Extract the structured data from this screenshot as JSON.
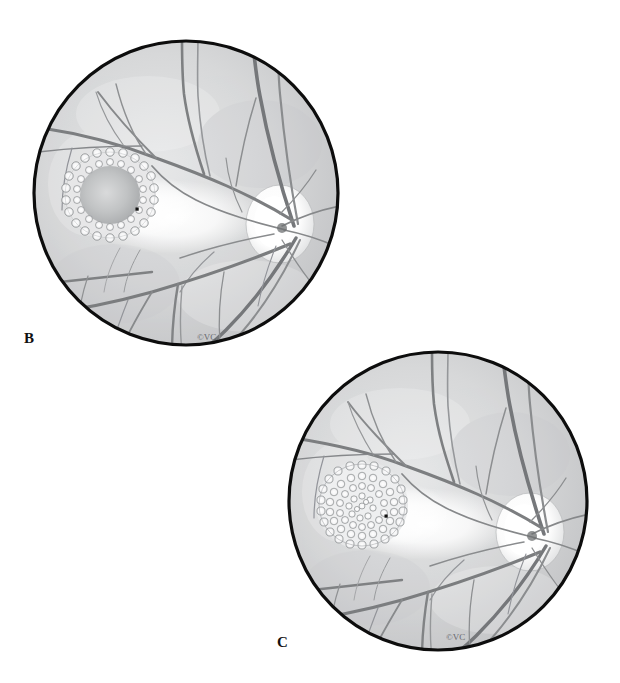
{
  "figure": {
    "modality": "fundus-drawing",
    "rendering": "grayscale pen-and-ink with wash",
    "background_color": "#ffffff",
    "panels": [
      {
        "id": "B",
        "label": "B",
        "label_position": {
          "x": 24,
          "y": 330
        },
        "signature": "©VC",
        "signature_position": {
          "x": 197,
          "y": 337
        },
        "circle": {
          "cx": 186,
          "cy": 193,
          "r": 156
        },
        "rim_color": "#0d0d0d",
        "fundus_color": "#d5d6d7",
        "description": "Right eye fundus with a ring of discrete pale drusen encircling a shaded macular lesion; optic disc temporal at right with radiating retinal vessels.",
        "lesion": {
          "name": "macular-lesion-ring",
          "cx": 110,
          "cy": 195,
          "rx": 45,
          "ry": 42,
          "pattern": "peripheral ring of drusen, clear shaded center",
          "drusen_rows": 2,
          "drusen_count": 46,
          "center_fill": "#b8babb"
        },
        "fovea_marker": {
          "x": 137,
          "y": 209,
          "size": 3,
          "color": "#111111"
        },
        "optic_disc": {
          "cx": 280,
          "cy": 222,
          "rx": 30,
          "ry": 36,
          "color": "#ffffff"
        },
        "macular_reflex": {
          "cx": 170,
          "cy": 215,
          "rx": 86,
          "ry": 36
        }
      },
      {
        "id": "C",
        "label": "C",
        "label_position": {
          "x": 277,
          "y": 634
        },
        "signature": "©VC",
        "signature_position": {
          "x": 448,
          "y": 637
        },
        "circle": {
          "cx": 438,
          "cy": 500,
          "r": 152
        },
        "rim_color": "#0d0d0d",
        "fundus_color": "#d5d6d7",
        "description": "Same eye at later stage: the macular lesion is now completely filled with confluent drusen in concentric rings.",
        "lesion": {
          "name": "macular-lesion-filled",
          "cx": 352,
          "cy": 511,
          "rx": 44,
          "ry": 42,
          "pattern": "fully confluent drusen filling entire lesion",
          "drusen_rows": 5,
          "drusen_count": 118,
          "center_fill": "#e8e9ea"
        },
        "fovea_marker": {
          "x": 386,
          "y": 520,
          "size": 3,
          "color": "#111111"
        },
        "optic_disc": {
          "cx": 527,
          "cy": 530,
          "rx": 30,
          "ry": 36,
          "color": "#ffffff"
        },
        "macular_reflex": {
          "cx": 412,
          "cy": 528,
          "rx": 84,
          "ry": 35
        }
      }
    ],
    "palette": {
      "rim": "#0d0d0d",
      "fundus_base": "#d5d6d7",
      "fundus_light": "#e9eaea",
      "fundus_shadow": "#b9babb",
      "vessel_dark": "#6f7173",
      "vessel_light": "#9a9c9e",
      "drusen_fill": "#fbfbfb",
      "drusen_edge": "#8e9092",
      "disc_white": "#ffffff",
      "label_text": "#111111"
    }
  }
}
